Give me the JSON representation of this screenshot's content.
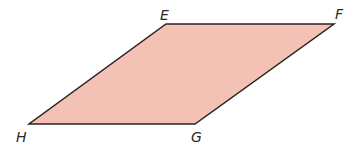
{
  "figure": {
    "shape": "parallelogram",
    "fill_color": "#f4c2b4",
    "stroke_color": "#2b2320",
    "vertices": [
      {
        "name": "E",
        "x": 166,
        "y": 24,
        "label_x": 160,
        "label_y": 20
      },
      {
        "name": "F",
        "x": 334,
        "y": 24,
        "label_x": 335,
        "label_y": 19
      },
      {
        "name": "G",
        "x": 195,
        "y": 124,
        "label_x": 191,
        "label_y": 142
      },
      {
        "name": "H",
        "x": 29,
        "y": 124,
        "label_x": 16,
        "label_y": 142
      }
    ]
  }
}
